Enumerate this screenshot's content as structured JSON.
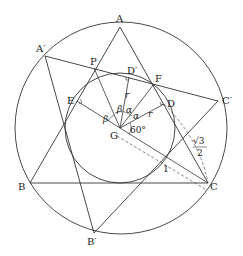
{
  "diagram": {
    "type": "geometry",
    "colors": {
      "stroke": "#333333",
      "dashed": "#555555",
      "background": "#ffffff"
    },
    "points": {
      "A": "A",
      "B": "B",
      "C": "C",
      "A_prime": "A′",
      "B_prime": "B′",
      "C_prime": "C′",
      "P": "P",
      "D": "D",
      "D_prime": "D′",
      "E": "E",
      "F": "F",
      "G": "G"
    },
    "angle_labels": {
      "alpha1": "α",
      "alpha2": "α",
      "beta1": "β",
      "beta2": "β",
      "sixty": "60°"
    },
    "segment_labels": {
      "r1": "r",
      "r2": "r",
      "one": "1",
      "sqrt3_num": "√3",
      "sqrt3_den": "2"
    }
  }
}
